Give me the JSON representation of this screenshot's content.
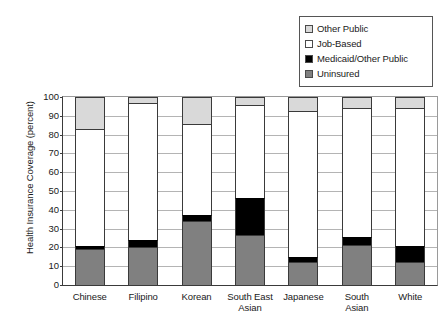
{
  "chart_data": {
    "type": "bar",
    "subtype": "stacked-bar-vertical",
    "title": "",
    "xlabel": "",
    "ylabel": "Health Insurance Coverage (percent)",
    "ylim": [
      0,
      100
    ],
    "ytick_labels": [
      "100",
      "90",
      "80",
      "70",
      "60",
      "50",
      "40",
      "30",
      "20",
      "10",
      "0"
    ],
    "ytick_values": [
      100,
      90,
      80,
      70,
      60,
      50,
      40,
      30,
      20,
      10,
      0
    ],
    "grid": true,
    "legend_position": "top-right",
    "categories": [
      "Chinese",
      "Filipino",
      "Korean",
      "South East Asian",
      "Japanese",
      "South Asian",
      "White"
    ],
    "category_lines": [
      [
        "Chinese",
        ""
      ],
      [
        "Filipino",
        ""
      ],
      [
        "Korean",
        ""
      ],
      [
        "South East",
        "Asian"
      ],
      [
        "Japanese",
        ""
      ],
      [
        "South",
        "Asian"
      ],
      [
        "White",
        ""
      ]
    ],
    "series": [
      {
        "name": "Other Public",
        "color": "#d9d9d9",
        "values": [
          17,
          3,
          14.5,
          4,
          7.5,
          6,
          6
        ]
      },
      {
        "name": "Job-Based",
        "color": "#ffffff",
        "values": [
          62,
          73,
          48,
          49.5,
          77.5,
          68.5,
          73
        ]
      },
      {
        "name": "Medicaid/Other Public",
        "color": "#000000",
        "values": [
          2,
          4,
          3.5,
          20,
          2.5,
          4,
          8.5
        ]
      },
      {
        "name": "Uninsured",
        "color": "#808080",
        "values": [
          19,
          20,
          34,
          26.5,
          12.5,
          21.5,
          12.5
        ]
      }
    ],
    "cumulative_tops": {
      "Chinese": {
        "uninsured": 19,
        "medicaid": 21,
        "job_based": 83,
        "other_public": 100
      },
      "Filipino": {
        "uninsured": 20,
        "medicaid": 24,
        "job_based": 97,
        "other_public": 100
      },
      "Korean": {
        "uninsured": 34,
        "medicaid": 37.5,
        "job_based": 85.5,
        "other_public": 100
      },
      "South East Asian": {
        "uninsured": 26.5,
        "medicaid": 46.5,
        "job_based": 96,
        "other_public": 100
      },
      "Japanese": {
        "uninsured": 12.5,
        "medicaid": 15,
        "job_based": 92.5,
        "other_public": 100
      },
      "South Asian": {
        "uninsured": 21.5,
        "medicaid": 25.5,
        "job_based": 94,
        "other_public": 100
      },
      "White": {
        "uninsured": 12.5,
        "medicaid": 21,
        "job_based": 94,
        "other_public": 100
      }
    }
  },
  "legend": {
    "items": [
      {
        "label": "Other Public",
        "color": "#d9d9d9"
      },
      {
        "label": "Job-Based",
        "color": "#ffffff"
      },
      {
        "label": "Medicaid/Other Public",
        "color": "#000000"
      },
      {
        "label": "Uninsured",
        "color": "#808080"
      }
    ]
  }
}
